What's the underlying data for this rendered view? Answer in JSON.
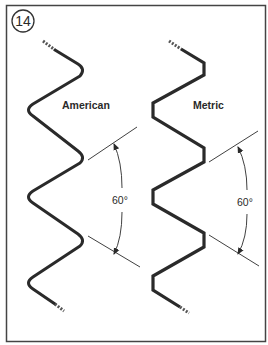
{
  "figure": {
    "number": "14",
    "border_color": "#444444",
    "ink_color": "#2a2a2a"
  },
  "threads": [
    {
      "name": "American",
      "profile": "rounded",
      "angle_label": "60°"
    },
    {
      "name": "Metric",
      "profile": "flat",
      "angle_label": "60°"
    }
  ]
}
